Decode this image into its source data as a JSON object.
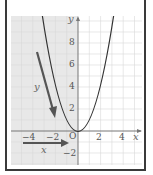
{
  "figure": {
    "axis_labels": {
      "x": "x",
      "y": "y",
      "origin": "O"
    },
    "y_ticks": [
      {
        "value": 8,
        "label": "8"
      },
      {
        "value": 6,
        "label": "6"
      },
      {
        "value": 4,
        "label": "4"
      },
      {
        "value": 2,
        "label": "2"
      },
      {
        "value": -2,
        "label": "−2"
      }
    ],
    "x_ticks": [
      {
        "value": -4,
        "label": "−4"
      },
      {
        "value": -2,
        "label": "−2"
      },
      {
        "value": 2,
        "label": "2"
      },
      {
        "value": 4,
        "label": "4"
      }
    ],
    "curve": "y = x^2",
    "arrows": {
      "y_arrow_label": "y",
      "x_arrow_label": "x"
    },
    "shaded_region": "x <= 0",
    "colors": {
      "shade": "#e6e6e6",
      "curve": "#333333",
      "arrow": "#555555",
      "axis": "#777777",
      "grid": "#dddddd"
    }
  }
}
